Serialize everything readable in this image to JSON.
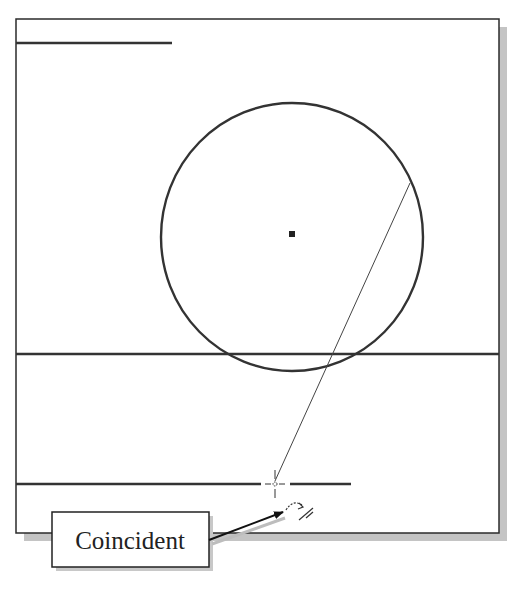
{
  "diagram": {
    "type": "cad-sketch",
    "background": "#ffffff",
    "frame": {
      "x": 16,
      "y": 19,
      "w": 483,
      "h": 514,
      "stroke": "#2b2b2b",
      "shadow": "#bdbdbd",
      "shadow_offset": 8
    },
    "lines": [
      {
        "name": "top-short-line",
        "x1": 16,
        "y1": 43,
        "x2": 172,
        "y2": 43,
        "width": 2.4
      },
      {
        "name": "middle-horizontal-line",
        "x1": 16,
        "y1": 354,
        "x2": 499,
        "y2": 354,
        "width": 2.4
      },
      {
        "name": "bottom-line-left-segment",
        "x1": 16,
        "y1": 484,
        "x2": 261,
        "y2": 484,
        "width": 2.4
      },
      {
        "name": "bottom-line-right-segment",
        "x1": 290,
        "y1": 484,
        "x2": 351,
        "y2": 484,
        "width": 2.4
      }
    ],
    "construction_line": {
      "x1": 410,
      "y1": 183,
      "x2": 275,
      "y2": 481,
      "width": 1
    },
    "circle": {
      "cx": 292,
      "cy": 237,
      "rx": 131,
      "ry": 134,
      "width": 2.4
    },
    "center_point": {
      "x": 292,
      "y": 234,
      "size": 6
    },
    "cursor": {
      "x": 275,
      "y": 484
    },
    "constraint_icon": {
      "x": 300,
      "y": 516
    },
    "callout": {
      "text": "Coincident",
      "box": {
        "x": 52,
        "y": 512,
        "w": 157,
        "h": 55
      },
      "arrow_to": {
        "x": 283,
        "y": 512
      }
    }
  }
}
